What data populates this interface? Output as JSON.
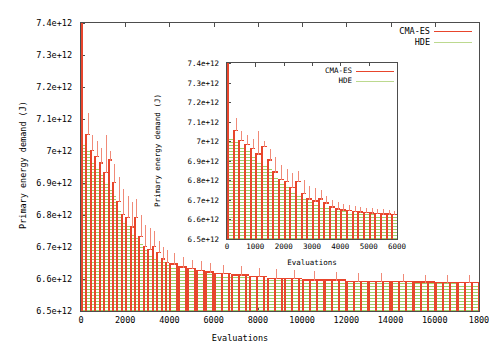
{
  "figure": {
    "background": "#ffffff",
    "colors": {
      "cma_es": "#e8452c",
      "hde": "#9fcf6a",
      "axis": "#4d4d4d",
      "text": "#000000"
    }
  },
  "main_chart": {
    "ylabel": "Primary energy demand (J)",
    "xlabel": "Evaluations",
    "yticks": [
      "6.5e+12",
      "6.6e+12",
      "6.7e+12",
      "6.8e+12",
      "6.9e+12",
      "7e+12",
      "7.1e+12",
      "7.2e+12",
      "7.3e+12",
      "7.4e+12"
    ],
    "xticks": [
      "0",
      "2000",
      "4000",
      "6000",
      "8000",
      "10000",
      "12000",
      "14000",
      "16000",
      "1800"
    ],
    "legend": [
      {
        "label": "CMA-ES",
        "color": "#e8452c"
      },
      {
        "label": "HDE",
        "color": "#9fcf6a"
      }
    ]
  },
  "inset_chart": {
    "ylabel": "Primary energy demand (J)",
    "xlabel": "Evaluations",
    "yticks": [
      "6.5e+12",
      "6.6e+12",
      "6.7e+12",
      "6.8e+12",
      "6.9e+12",
      "7e+12",
      "7.1e+12",
      "7.2e+12",
      "7.3e+12",
      "7.4e+12"
    ],
    "xticks": [
      "0",
      "1000",
      "2000",
      "3000",
      "4000",
      "5000",
      "6000"
    ],
    "legend": [
      {
        "label": "CMA-ES",
        "color": "#e8452c"
      },
      {
        "label": "HDE",
        "color": "#9fcf6a"
      }
    ]
  },
  "chart_data": {
    "type": "line",
    "title": "",
    "xlabel": "Evaluations",
    "ylabel": "Primary energy demand (J)",
    "note": "Convergence comparison of CMA-ES and HDE optimisation runs; vertical red segments are CMA-ES error bars, green horizontal hatching is the HDE band. Main panel spans the full 18000 evaluations, the inset zooms on the first 6000.",
    "panels": [
      {
        "name": "main",
        "xlim": [
          0,
          18000
        ],
        "ylim": [
          6500000000000.0,
          7400000000000.0
        ],
        "grid": false,
        "legend_position": "top-right",
        "x": [
          0,
          200,
          400,
          600,
          800,
          1000,
          1200,
          1400,
          1600,
          1800,
          2000,
          2200,
          2400,
          2600,
          2800,
          3000,
          3200,
          3400,
          3600,
          3800,
          4000,
          4400,
          4800,
          5200,
          5600,
          6000,
          6800,
          7600,
          8400,
          9200,
          10000,
          11000,
          12000,
          13000,
          14000,
          15000,
          16000,
          17000,
          18000
        ],
        "series": [
          {
            "name": "CMA-ES",
            "color": "#e8452c",
            "values": [
              7400000000000.0,
              7050000000000.0,
              7000000000000.0,
              6980000000000.0,
              6960000000000.0,
              6930000000000.0,
              6970000000000.0,
              6900000000000.0,
              6840000000000.0,
              6800000000000.0,
              6790000000000.0,
              6760000000000.0,
              6790000000000.0,
              6730000000000.0,
              6700000000000.0,
              6690000000000.0,
              6700000000000.0,
              6680000000000.0,
              6660000000000.0,
              6650000000000.0,
              6645000000000.0,
              6635000000000.0,
              6630000000000.0,
              6625000000000.0,
              6620000000000.0,
              6615000000000.0,
              6610000000000.0,
              6605000000000.0,
              6600000000000.0,
              6600000000000.0,
              6595000000000.0,
              6595000000000.0,
              6590000000000.0,
              6590000000000.0,
              6590000000000.0,
              6588000000000.0,
              6587000000000.0,
              6586000000000.0,
              6585000000000.0
            ],
            "upper_whisker": [
              7400000000000.0,
              7120000000000.0,
              7050000000000.0,
              7030000000000.0,
              7010000000000.0,
              7050000000000.0,
              7000000000000.0,
              6960000000000.0,
              6920000000000.0,
              6880000000000.0,
              6860000000000.0,
              6840000000000.0,
              6850000000000.0,
              6800000000000.0,
              6770000000000.0,
              6760000000000.0,
              6750000000000.0,
              6720000000000.0,
              6700000000000.0,
              6690000000000.0,
              6680000000000.0,
              6670000000000.0,
              6660000000000.0,
              6655000000000.0,
              6650000000000.0,
              6645000000000.0,
              6640000000000.0,
              6635000000000.0,
              6630000000000.0,
              6628000000000.0,
              6625000000000.0,
              6622000000000.0,
              6620000000000.0,
              6618000000000.0,
              6616000000000.0,
              6614000000000.0,
              6612000000000.0,
              6611000000000.0,
              6610000000000.0
            ]
          },
          {
            "name": "HDE",
            "color": "#9fcf6a",
            "values": [
              7020000000000.0,
              7000000000000.0,
              6970000000000.0,
              6950000000000.0,
              6930000000000.0,
              6900000000000.0,
              6880000000000.0,
              6860000000000.0,
              6820000000000.0,
              6780000000000.0,
              6770000000000.0,
              6740000000000.0,
              6730000000000.0,
              6710000000000.0,
              6690000000000.0,
              6675000000000.0,
              6670000000000.0,
              6660000000000.0,
              6655000000000.0,
              6648000000000.0,
              6642000000000.0,
              6632000000000.0,
              6628000000000.0,
              6622000000000.0,
              6618000000000.0,
              6612000000000.0,
              6608000000000.0,
              6603000000000.0,
              6599000000000.0,
              6598000000000.0,
              6594000000000.0,
              6593000000000.0,
              6589000000000.0,
              6589000000000.0,
              6588000000000.0,
              6587000000000.0,
              6586000000000.0,
              6585000000000.0,
              6584000000000.0
            ]
          }
        ]
      },
      {
        "name": "inset",
        "xlim": [
          0,
          6000
        ],
        "ylim": [
          6500000000000.0,
          7400000000000.0
        ],
        "grid": false,
        "legend_position": "top-right",
        "x": [
          0,
          200,
          400,
          600,
          800,
          1000,
          1200,
          1400,
          1600,
          1800,
          2000,
          2200,
          2400,
          2600,
          2800,
          3000,
          3200,
          3400,
          3600,
          3800,
          4000,
          4200,
          4400,
          4600,
          4800,
          5000,
          5200,
          5400,
          5600,
          5800
        ],
        "series": [
          {
            "name": "CMA-ES",
            "color": "#e8452c",
            "values": [
              7400000000000.0,
              7050000000000.0,
              7000000000000.0,
              6980000000000.0,
              6960000000000.0,
              6930000000000.0,
              6970000000000.0,
              6900000000000.0,
              6840000000000.0,
              6800000000000.0,
              6790000000000.0,
              6760000000000.0,
              6790000000000.0,
              6730000000000.0,
              6700000000000.0,
              6690000000000.0,
              6700000000000.0,
              6680000000000.0,
              6660000000000.0,
              6650000000000.0,
              6645000000000.0,
              6642000000000.0,
              6638000000000.0,
              6634000000000.0,
              6631000000000.0,
              6629000000000.0,
              6627000000000.0,
              6625000000000.0,
              6623000000000.0,
              6621000000000.0
            ],
            "upper_whisker": [
              7400000000000.0,
              7120000000000.0,
              7050000000000.0,
              7030000000000.0,
              7010000000000.0,
              7050000000000.0,
              7000000000000.0,
              6960000000000.0,
              6920000000000.0,
              6880000000000.0,
              6860000000000.0,
              6840000000000.0,
              6850000000000.0,
              6800000000000.0,
              6770000000000.0,
              6760000000000.0,
              6750000000000.0,
              6720000000000.0,
              6700000000000.0,
              6690000000000.0,
              6680000000000.0,
              6675000000000.0,
              6670000000000.0,
              6665000000000.0,
              6660000000000.0,
              6657000000000.0,
              6654000000000.0,
              6651000000000.0,
              6648000000000.0,
              6645000000000.0
            ]
          },
          {
            "name": "HDE",
            "color": "#9fcf6a",
            "values": [
              7020000000000.0,
              7000000000000.0,
              6970000000000.0,
              6950000000000.0,
              6930000000000.0,
              6900000000000.0,
              6880000000000.0,
              6860000000000.0,
              6820000000000.0,
              6780000000000.0,
              6770000000000.0,
              6740000000000.0,
              6730000000000.0,
              6710000000000.0,
              6690000000000.0,
              6675000000000.0,
              6670000000000.0,
              6660000000000.0,
              6655000000000.0,
              6648000000000.0,
              6642000000000.0,
              6639000000000.0,
              6635000000000.0,
              6631000000000.0,
              6628000000000.0,
              6626000000000.0,
              6624000000000.0,
              6622000000000.0,
              6620000000000.0,
              6618000000000.0
            ]
          }
        ]
      }
    ]
  }
}
